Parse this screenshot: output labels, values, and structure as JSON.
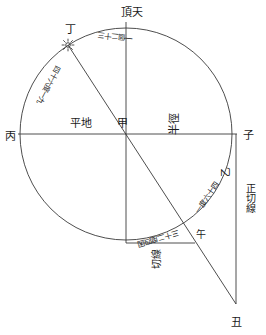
{
  "figure": {
    "type": "geometric-astronomical-diagram",
    "stroke_color": "#3a3a3a",
    "background_color": "#ffffff"
  },
  "points": {
    "zenith_top": "頂天",
    "center": "甲",
    "left": "丙",
    "right": "子",
    "sun_position": "丁",
    "arc_point_right": "乙",
    "arc_point_lower": "午",
    "tangent_end_bottom": "丑"
  },
  "lines": {
    "horizontal_label": "平地",
    "radius_label": "半徑",
    "tangent_vertical_label": "正切線",
    "tangent_bottom_label": "切線"
  },
  "arc_measures": {
    "upper_arc_to_sun": "一個二十三",
    "left_arc": "四十六度一九",
    "right_arc_upper": "一度六十四",
    "bottom_arc": "三十二度四因"
  },
  "icons": {
    "sun": "sun-icon"
  },
  "colors": {
    "ink": "#3a3a3a",
    "text": "#1a1a1a"
  }
}
